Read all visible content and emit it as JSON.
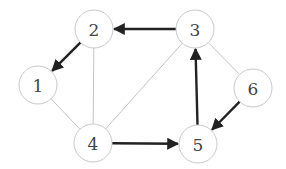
{
  "diagram": {
    "type": "graph",
    "colors": {
      "node_stroke": "#c8c8c8",
      "light_edge": "#c4c4c4",
      "directed_edge": "#222222",
      "label": "#444444"
    },
    "nodes": [
      {
        "id": "1",
        "label": "1",
        "x": 38,
        "y": 85
      },
      {
        "id": "2",
        "label": "2",
        "x": 94,
        "y": 29
      },
      {
        "id": "3",
        "label": "3",
        "x": 195,
        "y": 29
      },
      {
        "id": "4",
        "label": "4",
        "x": 93,
        "y": 143
      },
      {
        "id": "5",
        "label": "5",
        "x": 198,
        "y": 144
      },
      {
        "id": "6",
        "label": "6",
        "x": 253,
        "y": 88
      }
    ],
    "edges": [
      {
        "from": "3",
        "to": "2",
        "directed": true
      },
      {
        "from": "2",
        "to": "1",
        "directed": true
      },
      {
        "from": "2",
        "to": "4",
        "directed": false
      },
      {
        "from": "1",
        "to": "4",
        "directed": false
      },
      {
        "from": "4",
        "to": "3",
        "directed": false
      },
      {
        "from": "4",
        "to": "5",
        "directed": true
      },
      {
        "from": "5",
        "to": "3",
        "directed": true
      },
      {
        "from": "3",
        "to": "6",
        "directed": false
      },
      {
        "from": "6",
        "to": "5",
        "directed": true
      }
    ]
  }
}
